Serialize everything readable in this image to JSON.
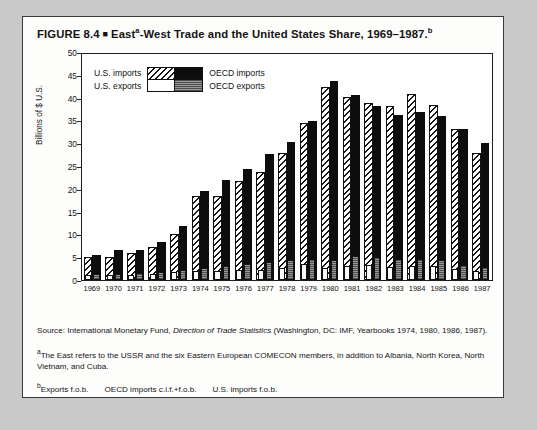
{
  "figure": {
    "label": "FIGURE 8.4",
    "marker": "■",
    "title_main": "East",
    "title_sup_a": "a",
    "title_rest": "-West Trade and the United States Share, 1969–1987.",
    "title_sup_b": "b",
    "title_plain": "FIGURE 8.4 ■ Easta-West Trade and the United States Share, 1969–1987.b"
  },
  "legend": {
    "us_imports": "U.S. imports",
    "us_exports": "U.S. exports",
    "oecd_imports": "OECD imports",
    "oecd_exports": "OECD exports"
  },
  "notes": {
    "source_prefix": "Source: International Monetary Fund, ",
    "source_italic": "Direction of Trade Statistics",
    "source_suffix": " (Washington, DC: IMF, Yearbooks 1974, 1980, 1986, 1987).",
    "footnote_a_marker": "a",
    "footnote_a": "The East refers to the USSR and the six Eastern European COMECON members, in addition to Albania, North Korea, North Vietnam, and Cuba.",
    "footnote_b_marker": "b",
    "footnote_b_1": "Exports f.o.b.",
    "footnote_b_2": "OECD imports c.i.f.+f.o.b.",
    "footnote_b_3": "U.S. imports f.o.b."
  },
  "chart_data": {
    "type": "bar",
    "xlabel": "",
    "ylabel": "Billions of $ U.S.",
    "ylim": [
      0,
      50
    ],
    "yticks": [
      0,
      5,
      10,
      15,
      20,
      25,
      30,
      35,
      40,
      45,
      50
    ],
    "grid": false,
    "legend_position": "top-left",
    "categories": [
      "1969",
      "1970",
      "1971",
      "1972",
      "1973",
      "1974",
      "1975",
      "1976",
      "1977",
      "1978",
      "1979",
      "1980",
      "1981",
      "1982",
      "1983",
      "1984",
      "1985",
      "1986",
      "1987"
    ],
    "series": [
      {
        "name": "U.S. imports",
        "pattern": "diagonal-hatch",
        "values": [
          5.0,
          5.2,
          6.0,
          7.2,
          10.2,
          18.6,
          18.6,
          22.0,
          23.8,
          28.0,
          34.8,
          42.6,
          40.4,
          39.2,
          38.6,
          41.2,
          38.8,
          33.4,
          28.2
        ]
      },
      {
        "name": "OECD imports",
        "pattern": "solid-black",
        "values": [
          5.6,
          6.6,
          6.6,
          8.4,
          12.0,
          19.8,
          22.2,
          24.6,
          27.8,
          30.6,
          35.2,
          44.0,
          41.0,
          38.4,
          36.6,
          37.2,
          36.2,
          33.4,
          30.4
        ]
      },
      {
        "name": "U.S. exports",
        "pattern": "white",
        "values": [
          1.0,
          1.0,
          1.2,
          1.4,
          1.8,
          2.0,
          2.0,
          2.2,
          2.2,
          2.6,
          3.6,
          2.6,
          3.2,
          3.4,
          2.8,
          3.0,
          3.2,
          2.4,
          2.0
        ]
      },
      {
        "name": "OECD exports",
        "pattern": "gray-stipple",
        "values": [
          1.4,
          1.4,
          1.6,
          1.8,
          2.2,
          2.6,
          3.2,
          3.6,
          4.0,
          4.4,
          4.6,
          4.4,
          5.4,
          5.2,
          4.6,
          4.6,
          4.4,
          3.4,
          2.8
        ]
      }
    ]
  }
}
